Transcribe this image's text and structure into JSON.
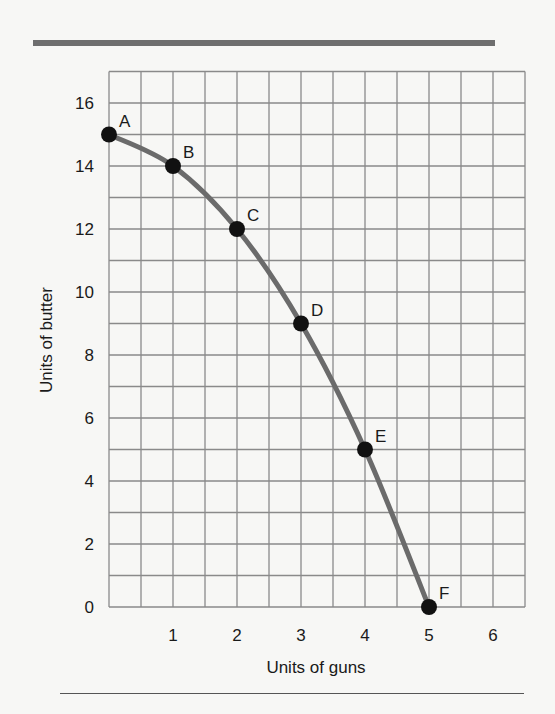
{
  "chart_data": {
    "type": "line",
    "title": "",
    "xlabel": "Units of guns",
    "ylabel": "Units of butter",
    "xlim": [
      0,
      6.5
    ],
    "ylim": [
      0,
      17
    ],
    "x_ticks": [
      "1",
      "2",
      "3",
      "4",
      "5",
      "6"
    ],
    "y_ticks": [
      "0",
      "2",
      "4",
      "6",
      "8",
      "10",
      "12",
      "14",
      "16"
    ],
    "grid": true,
    "series": [
      {
        "name": "Production possibilities frontier",
        "color": "#6b6b6b",
        "points": [
          {
            "label": "A",
            "x": 0,
            "y": 15
          },
          {
            "label": "B",
            "x": 1,
            "y": 14
          },
          {
            "label": "C",
            "x": 2,
            "y": 12
          },
          {
            "label": "D",
            "x": 3,
            "y": 9
          },
          {
            "label": "E",
            "x": 4,
            "y": 5
          },
          {
            "label": "F",
            "x": 5,
            "y": 0
          }
        ]
      }
    ]
  }
}
